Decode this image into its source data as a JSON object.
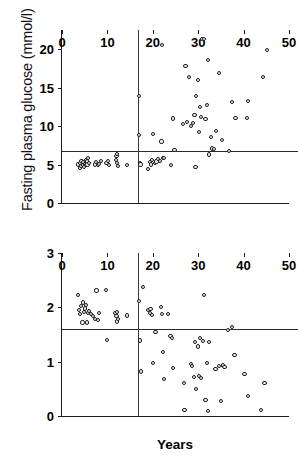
{
  "figure": {
    "background": "#ffffff",
    "marker_color": "#1c1c1c",
    "axis_color": "#1a1a1a",
    "refline_color": "#2b2b2b"
  },
  "chart_data": [
    {
      "type": "scatter",
      "panel": "top",
      "title": "",
      "xlabel": "",
      "ylabel": "Fasting plasma glucose (mmol/l)",
      "xlim": [
        0,
        50
      ],
      "ylim": [
        0,
        22.5
      ],
      "xticks": [
        0,
        10,
        20,
        30,
        40,
        50
      ],
      "yticks": [
        0,
        5,
        10,
        15,
        20
      ],
      "grid": false,
      "legend": "none",
      "annotations": {
        "horizontal_reference_line": 6.7,
        "vertical_reference_line": 16.7
      },
      "points": [
        [
          3.6,
          5.0
        ],
        [
          3.9,
          4.6
        ],
        [
          4.0,
          5.2
        ],
        [
          4.2,
          4.8
        ],
        [
          4.3,
          5.5
        ],
        [
          4.6,
          4.9
        ],
        [
          4.7,
          5.3
        ],
        [
          4.9,
          4.7
        ],
        [
          5.0,
          5.1
        ],
        [
          5.2,
          5.6
        ],
        [
          5.3,
          4.9
        ],
        [
          5.5,
          5.4
        ],
        [
          5.6,
          5.0
        ],
        [
          5.8,
          5.8
        ],
        [
          6.0,
          5.2
        ],
        [
          7.2,
          5.0
        ],
        [
          7.5,
          5.3
        ],
        [
          7.9,
          4.9
        ],
        [
          8.2,
          5.1
        ],
        [
          8.6,
          5.5
        ],
        [
          9.8,
          5.2
        ],
        [
          10.1,
          5.5
        ],
        [
          10.3,
          4.9
        ],
        [
          11.9,
          5.6
        ],
        [
          12.0,
          6.1
        ],
        [
          12.1,
          5.2
        ],
        [
          12.2,
          6.4
        ],
        [
          12.3,
          4.8
        ],
        [
          14.4,
          4.9
        ],
        [
          16.9,
          13.9
        ],
        [
          17.0,
          8.8
        ],
        [
          17.1,
          5.2
        ],
        [
          17.3,
          5.0
        ],
        [
          19.0,
          4.4
        ],
        [
          19.3,
          5.3
        ],
        [
          19.6,
          5.0
        ],
        [
          19.9,
          5.6
        ],
        [
          20.1,
          9.0
        ],
        [
          20.4,
          5.2
        ],
        [
          20.8,
          5.4
        ],
        [
          21.2,
          5.7
        ],
        [
          21.6,
          5.5
        ],
        [
          21.9,
          8.0
        ],
        [
          22.0,
          20.6
        ],
        [
          22.3,
          5.8
        ],
        [
          22.5,
          5.9
        ],
        [
          24.0,
          4.9
        ],
        [
          24.4,
          11.0
        ],
        [
          24.8,
          6.9
        ],
        [
          26.6,
          10.3
        ],
        [
          27.2,
          17.8
        ],
        [
          27.5,
          10.5
        ],
        [
          28.0,
          16.4
        ],
        [
          28.4,
          10.0
        ],
        [
          28.8,
          10.4
        ],
        [
          29.2,
          11.4
        ],
        [
          29.4,
          4.7
        ],
        [
          29.6,
          13.9
        ],
        [
          29.9,
          16.0
        ],
        [
          30.2,
          9.2
        ],
        [
          30.4,
          12.5
        ],
        [
          30.6,
          11.2
        ],
        [
          30.8,
          21.3
        ],
        [
          31.3,
          21.3
        ],
        [
          31.6,
          10.9
        ],
        [
          32.0,
          12.7
        ],
        [
          32.2,
          18.6
        ],
        [
          32.4,
          6.3
        ],
        [
          32.8,
          8.6
        ],
        [
          33.1,
          7.1
        ],
        [
          33.4,
          7.0
        ],
        [
          34.0,
          9.4
        ],
        [
          34.6,
          16.9
        ],
        [
          35.2,
          8.2
        ],
        [
          36.8,
          6.8
        ],
        [
          37.5,
          13.1
        ],
        [
          38.2,
          11.1
        ],
        [
          40.8,
          11.1
        ],
        [
          41.0,
          13.3
        ],
        [
          44.2,
          16.4
        ],
        [
          45.2,
          19.9
        ]
      ]
    },
    {
      "type": "scatter",
      "panel": "bottom",
      "title": "",
      "xlabel": "Years",
      "ylabel": "Glucose storage (mmol/min)",
      "xlim": [
        0,
        50
      ],
      "ylim": [
        0,
        3
      ],
      "xticks": [
        0,
        10,
        20,
        30,
        40,
        50
      ],
      "yticks": [
        0,
        1,
        2,
        3
      ],
      "grid": false,
      "legend": "none",
      "annotations": {
        "horizontal_reference_line": 1.61,
        "vertical_reference_line": 16.7
      },
      "points": [
        [
          3.6,
          2.23
        ],
        [
          3.8,
          1.95
        ],
        [
          4.0,
          1.88
        ],
        [
          4.2,
          2.02
        ],
        [
          4.5,
          1.72
        ],
        [
          4.7,
          2.09
        ],
        [
          4.9,
          1.92
        ],
        [
          5.1,
          1.98
        ],
        [
          5.3,
          2.05
        ],
        [
          5.5,
          1.72
        ],
        [
          5.7,
          1.9
        ],
        [
          6.0,
          1.93
        ],
        [
          6.4,
          1.88
        ],
        [
          6.8,
          1.84
        ],
        [
          7.2,
          1.79
        ],
        [
          7.6,
          2.31
        ],
        [
          7.9,
          1.76
        ],
        [
          8.2,
          1.9
        ],
        [
          9.7,
          2.32
        ],
        [
          9.9,
          1.4
        ],
        [
          11.8,
          1.9
        ],
        [
          12.0,
          1.84
        ],
        [
          12.1,
          1.74
        ],
        [
          12.2,
          1.92
        ],
        [
          12.4,
          1.78
        ],
        [
          14.3,
          1.85
        ],
        [
          17.0,
          2.11
        ],
        [
          17.2,
          1.39
        ],
        [
          17.4,
          0.82
        ],
        [
          17.8,
          2.38
        ],
        [
          19.0,
          1.95
        ],
        [
          19.3,
          1.9
        ],
        [
          19.5,
          1.97
        ],
        [
          19.8,
          1.86
        ],
        [
          20.0,
          0.98
        ],
        [
          20.6,
          1.55
        ],
        [
          21.8,
          2.01
        ],
        [
          22.0,
          1.87
        ],
        [
          22.2,
          1.18
        ],
        [
          22.4,
          0.68
        ],
        [
          23.4,
          1.88
        ],
        [
          23.9,
          1.47
        ],
        [
          24.2,
          1.44
        ],
        [
          24.4,
          0.88
        ],
        [
          26.8,
          0.6
        ],
        [
          27.0,
          0.11
        ],
        [
          28.4,
          0.95
        ],
        [
          28.7,
          0.92
        ],
        [
          29.0,
          0.72
        ],
        [
          29.3,
          1.36
        ],
        [
          29.6,
          0.5
        ],
        [
          29.9,
          1.28
        ],
        [
          30.2,
          0.73
        ],
        [
          30.4,
          1.44
        ],
        [
          30.7,
          0.7
        ],
        [
          31.0,
          1.38
        ],
        [
          31.3,
          2.22
        ],
        [
          31.6,
          0.3
        ],
        [
          31.9,
          0.97
        ],
        [
          32.1,
          0.09
        ],
        [
          32.4,
          1.36
        ],
        [
          33.8,
          0.87
        ],
        [
          34.6,
          0.92
        ],
        [
          35.0,
          0.27
        ],
        [
          35.4,
          0.93
        ],
        [
          35.8,
          0.9
        ],
        [
          36.6,
          1.58
        ],
        [
          37.4,
          1.64
        ],
        [
          38.0,
          1.12
        ],
        [
          40.2,
          0.78
        ],
        [
          41.0,
          0.37
        ],
        [
          43.8,
          0.11
        ],
        [
          44.6,
          0.6
        ]
      ]
    }
  ]
}
